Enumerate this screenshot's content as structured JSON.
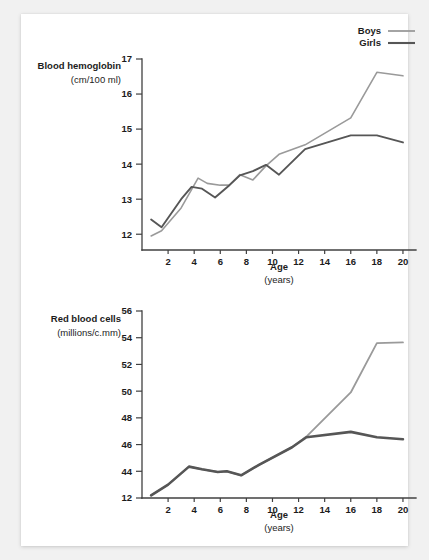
{
  "figure": {
    "background_color": "#f1f1f1",
    "card_color": "#ffffff"
  },
  "legend": {
    "position": "top-right",
    "entries": [
      {
        "label": "Boys",
        "color": "#9a9a9a"
      },
      {
        "label": "Girls",
        "color": "#565656"
      }
    ]
  },
  "charts": [
    {
      "id": "hemoglobin",
      "ylabel_line1": "Blood hemoglobin",
      "ylabel_line2": "(cm/100 ml)",
      "xlabel_line1": "Age",
      "xlabel_line2": "(years)"
    },
    {
      "id": "red-blood-cells",
      "ylabel_line1": "Red blood cells",
      "ylabel_line2": "(millions/c.mm)",
      "xlabel_line1": "Age",
      "xlabel_line2": "(years)"
    }
  ],
  "chart_data": [
    {
      "type": "line",
      "id": "hemoglobin",
      "title": "",
      "xlabel": "Age (years)",
      "ylabel": "Blood hemoglobin (cm/100 ml)",
      "xlim": [
        0,
        21
      ],
      "ylim": [
        11.55,
        17
      ],
      "xticks": [
        2,
        4,
        6,
        8,
        10,
        12,
        14,
        16,
        18,
        20
      ],
      "yticks": [
        12,
        13,
        14,
        15,
        16,
        17
      ],
      "grid": false,
      "legend_position": "top-right",
      "series": [
        {
          "name": "Boys",
          "color": "#9a9a9a",
          "x": [
            0.7,
            1.5,
            3.0,
            4.3,
            5.0,
            6.0,
            6.7,
            7.5,
            8.5,
            9.5,
            10.5,
            12.5,
            16.0,
            18.0,
            20.0
          ],
          "y": [
            11.95,
            12.1,
            12.75,
            13.6,
            13.45,
            13.4,
            13.4,
            13.7,
            13.55,
            13.95,
            14.28,
            14.55,
            15.32,
            16.62,
            16.52
          ]
        },
        {
          "name": "Girls",
          "color": "#565656",
          "x": [
            0.7,
            1.5,
            3.0,
            3.8,
            4.6,
            5.6,
            6.7,
            7.5,
            8.5,
            9.5,
            10.5,
            12.5,
            16.0,
            18.0,
            20.0
          ],
          "y": [
            12.42,
            12.2,
            13.0,
            13.35,
            13.3,
            13.05,
            13.4,
            13.68,
            13.8,
            13.98,
            13.7,
            14.43,
            14.82,
            14.82,
            14.62
          ]
        }
      ]
    },
    {
      "type": "line",
      "id": "red-blood-cells",
      "title": "",
      "xlabel": "Age (years)",
      "ylabel": "Red blood cells (millions/c.mm)",
      "xlim": [
        0,
        21
      ],
      "ylim": [
        42.0,
        56.0
      ],
      "xticks": [
        2,
        4,
        6,
        8,
        10,
        12,
        14,
        16,
        18,
        20
      ],
      "ytick_labels": [
        "12",
        "44",
        "46",
        "48",
        "50",
        "52",
        "54",
        "56"
      ],
      "yticks": [
        42,
        44,
        46,
        48,
        50,
        52,
        54,
        56
      ],
      "grid": false,
      "legend_position": "top-right",
      "series": [
        {
          "name": "Boys",
          "color": "#9a9a9a",
          "x": [
            0.7,
            2.0,
            3.6,
            4.6,
            5.8,
            6.5,
            7.6,
            9.0,
            11.5,
            12.6,
            16.0,
            18.0,
            20.0
          ],
          "y": [
            42.2,
            43.0,
            44.35,
            44.15,
            43.95,
            44.0,
            43.7,
            44.5,
            45.8,
            46.6,
            49.9,
            53.6,
            53.65
          ]
        },
        {
          "name": "Girls",
          "color": "#565656",
          "x": [
            0.7,
            2.0,
            3.6,
            4.6,
            5.8,
            6.5,
            7.6,
            9.0,
            11.5,
            12.6,
            16.0,
            18.0,
            20.0
          ],
          "y": [
            42.2,
            43.0,
            44.35,
            44.15,
            43.95,
            44.0,
            43.7,
            44.5,
            45.8,
            46.55,
            46.95,
            46.55,
            46.4
          ]
        }
      ]
    }
  ]
}
